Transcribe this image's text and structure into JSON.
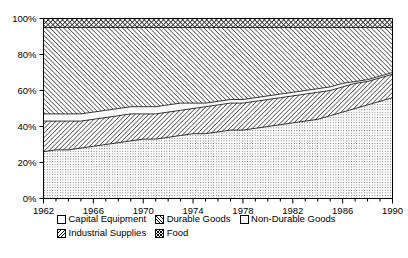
{
  "chart_data": {
    "type": "area",
    "stacked_100pct": true,
    "title": "",
    "xlabel": "",
    "ylabel": "",
    "xlim": [
      1962,
      1990
    ],
    "ylim": [
      0,
      100
    ],
    "ytick_labels": [
      "0%",
      "20%",
      "40%",
      "60%",
      "80%",
      "100%"
    ],
    "ytick_values": [
      0,
      20,
      40,
      60,
      80,
      100
    ],
    "xtick_labels": [
      "1962",
      "1966",
      "1970",
      "1974",
      "1978",
      "1982",
      "1986",
      "1990"
    ],
    "xtick_values": [
      1962,
      1966,
      1970,
      1974,
      1978,
      1982,
      1986,
      1990
    ],
    "minor_xticks_every": 1,
    "grid": false,
    "legend_position": "below-axes",
    "x": [
      1962,
      1963,
      1964,
      1965,
      1966,
      1967,
      1968,
      1969,
      1970,
      1971,
      1972,
      1973,
      1974,
      1975,
      1976,
      1977,
      1978,
      1979,
      1980,
      1981,
      1982,
      1983,
      1984,
      1985,
      1986,
      1987,
      1988,
      1989,
      1990
    ],
    "series": [
      {
        "name": "Capital Equipment",
        "pattern": "fine-dot-stipple",
        "stack_order": 1,
        "values": [
          26,
          27,
          27,
          28,
          29,
          30,
          31,
          32,
          33,
          33,
          34,
          35,
          36,
          36,
          37,
          38,
          38,
          39,
          40,
          41,
          42,
          43,
          44,
          46,
          48,
          50,
          52,
          54,
          56
        ]
      },
      {
        "name": "Industrial Supplies",
        "pattern": "backslash-hatch",
        "stack_order": 2,
        "values": [
          17,
          16,
          16,
          15,
          15,
          15,
          15,
          15,
          14,
          14,
          14,
          14,
          14,
          15,
          15,
          15,
          15,
          15,
          15,
          15,
          15,
          15,
          15,
          14,
          14,
          14,
          13,
          13,
          13
        ]
      },
      {
        "name": "Non-Durable Goods",
        "pattern": "white-blank",
        "stack_order": 3,
        "values": [
          4,
          4,
          4,
          4,
          4,
          4,
          4,
          4,
          4,
          4,
          4,
          4,
          3,
          2,
          2,
          2,
          2,
          2,
          2,
          2,
          2,
          2,
          2,
          2,
          2,
          1,
          1,
          1,
          1
        ]
      },
      {
        "name": "Durable Goods",
        "pattern": "forward-slash-hatch",
        "stack_order": 4,
        "values": [
          48,
          48,
          48,
          48,
          47,
          46,
          45,
          44,
          44,
          44,
          43,
          42,
          42,
          42,
          41,
          40,
          40,
          39,
          38,
          37,
          36,
          35,
          34,
          33,
          31,
          30,
          29,
          27,
          25
        ]
      },
      {
        "name": "Food",
        "pattern": "cross-hatch",
        "stack_order": 5,
        "values": [
          5,
          5,
          5,
          5,
          5,
          5,
          5,
          5,
          5,
          5,
          5,
          5,
          5,
          5,
          5,
          5,
          5,
          5,
          5,
          5,
          5,
          5,
          5,
          5,
          5,
          5,
          5,
          5,
          5
        ]
      }
    ],
    "cumulative_boundaries": {
      "capital_equipment_top": [
        26,
        27,
        27,
        28,
        29,
        30,
        31,
        32,
        33,
        33,
        34,
        35,
        36,
        36,
        37,
        38,
        38,
        39,
        40,
        41,
        42,
        43,
        44,
        46,
        48,
        50,
        52,
        54,
        56
      ],
      "industrial_supplies_top": [
        43,
        43,
        43,
        43,
        44,
        45,
        46,
        47,
        47,
        47,
        48,
        49,
        50,
        51,
        52,
        53,
        53,
        54,
        55,
        56,
        57,
        58,
        59,
        60,
        62,
        64,
        65,
        67,
        69
      ],
      "non_durable_goods_top": [
        47,
        47,
        47,
        47,
        48,
        49,
        50,
        51,
        51,
        51,
        52,
        53,
        53,
        53,
        54,
        55,
        55,
        56,
        57,
        58,
        59,
        60,
        61,
        62,
        64,
        65,
        66,
        68,
        70
      ],
      "durable_goods_top": [
        95,
        95,
        95,
        95,
        95,
        95,
        95,
        95,
        95,
        95,
        95,
        95,
        95,
        95,
        95,
        95,
        95,
        95,
        95,
        95,
        95,
        95,
        95,
        95,
        95,
        95,
        95,
        95,
        95
      ],
      "food_top": [
        100,
        100,
        100,
        100,
        100,
        100,
        100,
        100,
        100,
        100,
        100,
        100,
        100,
        100,
        100,
        100,
        100,
        100,
        100,
        100,
        100,
        100,
        100,
        100,
        100,
        100,
        100,
        100,
        100
      ]
    }
  },
  "legend": {
    "rows": [
      [
        {
          "label": "Capital Equipment",
          "swatch": "fine-dot-stipple"
        },
        {
          "label": "Durable Goods",
          "swatch": "forward-slash-hatch"
        },
        {
          "label": "Non-Durable Goods",
          "swatch": "white-blank"
        }
      ],
      [
        {
          "label": "Industrial Supplies",
          "swatch": "backslash-hatch"
        },
        {
          "label": "Food",
          "swatch": "cross-hatch"
        }
      ]
    ]
  },
  "axes": {
    "frame_color": "#000000"
  }
}
